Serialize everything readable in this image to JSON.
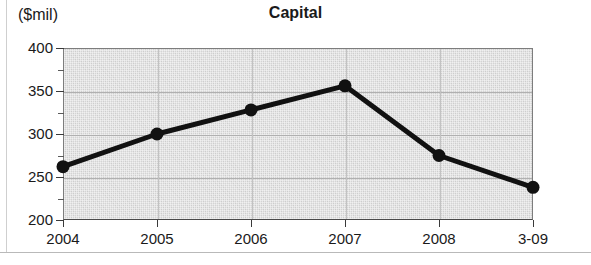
{
  "chart_data": {
    "type": "line",
    "title": "Capital",
    "unit_label": "($mil)",
    "xlabel": "",
    "ylabel": "",
    "categories": [
      "2004",
      "2005",
      "2006",
      "2007",
      "2008",
      "3-09"
    ],
    "values": [
      262,
      300,
      328,
      356,
      275,
      238
    ],
    "series": [
      {
        "name": "Capital",
        "values": [
          262,
          300,
          328,
          356,
          275,
          238
        ]
      }
    ],
    "ylim": [
      200,
      400
    ],
    "ytick_labels": [
      "400",
      "350",
      "300",
      "250",
      "200"
    ],
    "ytick_values": [
      400,
      350,
      300,
      250,
      200
    ],
    "yminor_tick_values": [
      375,
      325,
      275,
      225
    ],
    "grid": true,
    "legend": false,
    "legend_position": "none",
    "colors": {
      "line": "#111111",
      "marker": "#111111",
      "plot_background": "#d9d9d9",
      "gridline": "#b0b0b0",
      "axis": "#3a3a3a",
      "text": "#1a1a1a"
    }
  }
}
